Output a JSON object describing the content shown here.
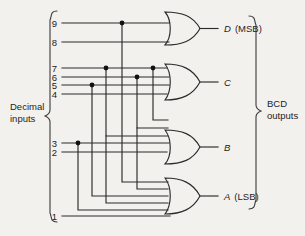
{
  "diagram": {
    "background_color": "#f3f1ee",
    "line_color": "#2b2b2b",
    "groups": {
      "inputs_label_line1": "Decimal",
      "inputs_label_line2": "inputs",
      "outputs_label_line1": "BCD",
      "outputs_label_line2": "outputs"
    },
    "inputs": [
      {
        "label": "9",
        "y": 23
      },
      {
        "label": "8",
        "y": 42
      },
      {
        "label": "7",
        "y": 68
      },
      {
        "label": "6",
        "y": 77
      },
      {
        "label": "5",
        "y": 85
      },
      {
        "label": "4",
        "y": 94
      },
      {
        "label": "3",
        "y": 143
      },
      {
        "label": "2",
        "y": 152
      },
      {
        "label": "1",
        "y": 216
      }
    ],
    "outputs": [
      {
        "symbol": "D",
        "note": "(MSB)",
        "y": 28
      },
      {
        "symbol": "C",
        "note": "",
        "y": 82
      },
      {
        "symbol": "B",
        "note": "",
        "y": 147
      },
      {
        "symbol": "A",
        "note": "(LSB)",
        "y": 196
      }
    ],
    "gates": [
      {
        "name": "or-gate-d",
        "output": "D",
        "inputs": [
          "9",
          "8"
        ],
        "y_top": 12,
        "y_bottom": 45
      },
      {
        "name": "or-gate-c",
        "output": "C",
        "inputs": [
          "7",
          "6",
          "5",
          "4"
        ],
        "y_top": 64,
        "y_bottom": 100
      },
      {
        "name": "or-gate-b",
        "output": "B",
        "inputs": [
          "7",
          "6",
          "3",
          "2"
        ],
        "y_top": 130,
        "y_bottom": 164
      },
      {
        "name": "or-gate-a",
        "output": "A",
        "inputs": [
          "9",
          "7",
          "5",
          "3",
          "1"
        ],
        "y_top": 178,
        "y_bottom": 214
      }
    ],
    "junctions": [
      {
        "on_line": "9",
        "x": 122,
        "y": 23
      },
      {
        "on_line": "7",
        "x": 106,
        "y": 68
      },
      {
        "on_line": "7",
        "x": 153,
        "y": 68
      },
      {
        "on_line": "6",
        "x": 137,
        "y": 77
      },
      {
        "on_line": "5",
        "x": 92,
        "y": 85
      },
      {
        "on_line": "3",
        "x": 78,
        "y": 143
      }
    ]
  }
}
